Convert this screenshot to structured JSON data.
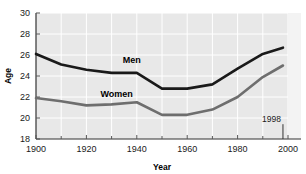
{
  "chart_data": {
    "type": "line",
    "title": "",
    "xlabel": "Year",
    "ylabel": "Age",
    "xlim": [
      1900,
      2000
    ],
    "ylim": [
      18,
      30
    ],
    "xticks": [
      1900,
      1920,
      1940,
      1960,
      1980,
      2000
    ],
    "xtick_labels": [
      "1900",
      "1920",
      "1940",
      "1960",
      "1980",
      "2000"
    ],
    "xminor_ticks": [
      1910,
      1930,
      1950,
      1970,
      1990
    ],
    "yticks": [
      18,
      20,
      22,
      24,
      26,
      28,
      30
    ],
    "ytick_labels": [
      "18",
      "20",
      "22",
      "24",
      "26",
      "28",
      "30"
    ],
    "grid": true,
    "grid_color": "#ffffff",
    "plot_background": "#e8e8e8",
    "legend": "inline-labels",
    "x": [
      1900,
      1910,
      1920,
      1930,
      1940,
      1950,
      1960,
      1970,
      1980,
      1990,
      1998
    ],
    "series": [
      {
        "name": "Men",
        "color": "#1a1a1a",
        "values": [
          26.1,
          25.1,
          24.6,
          24.3,
          24.3,
          22.8,
          22.8,
          23.2,
          24.7,
          26.1,
          26.7
        ],
        "label_x": 1938,
        "label_y": 25.2
      },
      {
        "name": "Women",
        "color": "#6e6e6e",
        "values": [
          21.9,
          21.6,
          21.2,
          21.3,
          21.5,
          20.3,
          20.3,
          20.8,
          22.0,
          23.9,
          25.0
        ],
        "label_x": 1932,
        "label_y": 22.0
      }
    ],
    "annotations": [
      {
        "name": "final-year-marker",
        "text": "1998",
        "x": 1998,
        "text_y": 19.6
      }
    ]
  }
}
